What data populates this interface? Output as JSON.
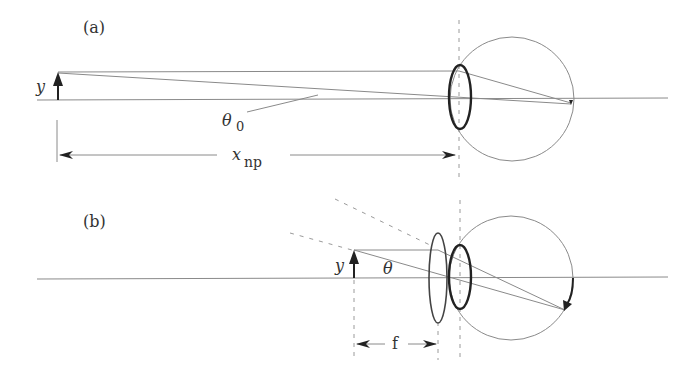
{
  "figure": {
    "panel_a": {
      "label": "(a)",
      "object_label": "y",
      "angle_label": "θ",
      "angle_subscript": "0",
      "distance_label": "x",
      "distance_subscript": "np"
    },
    "panel_b": {
      "label": "(b)",
      "object_label": "y",
      "angle_label": "θ",
      "distance_label": "f"
    },
    "colors": {
      "line": "#8a8a8a",
      "thick": "#222222",
      "dashed": "#9a9a9a"
    }
  }
}
